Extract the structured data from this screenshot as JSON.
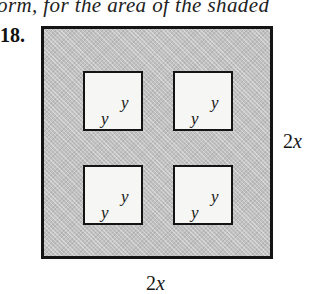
{
  "document": {
    "header_fragment": "orm, for the area of the shaded",
    "problem_number": "18."
  },
  "figure": {
    "outer_square": {
      "side_label": {
        "coefficient": "2",
        "variable": "x"
      },
      "fill_color": "#c1c1c1",
      "border_color": "#141414"
    },
    "inner_squares": {
      "count": 4,
      "side_label": "y",
      "fill_color": "#f6f6f4"
    }
  }
}
